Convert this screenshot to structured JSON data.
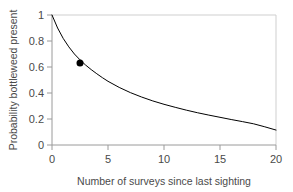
{
  "chart_data": {
    "type": "line",
    "title": "",
    "subtitle": "",
    "xlabel": "Number of surveys since last sighting",
    "ylabel": "Probability bottleweed present",
    "xlim": [
      0,
      20
    ],
    "ylim": [
      0,
      1
    ],
    "xticks": [
      0,
      5,
      10,
      15,
      20
    ],
    "xtick_labels": [
      "0",
      "5",
      "10",
      "15",
      "20"
    ],
    "yticks": [
      0,
      0.2,
      0.4,
      0.6,
      0.8,
      1
    ],
    "ytick_labels": [
      "0",
      "0.2",
      "0.4",
      "0.6",
      "0.8",
      "1"
    ],
    "grid": false,
    "legend": null,
    "legend_position": "none",
    "series": [
      {
        "name": "probability-curve",
        "type": "line",
        "color": "#000000",
        "linewidth": 1,
        "x": [
          0,
          0.5,
          1,
          1.5,
          2,
          2.5,
          3,
          3.5,
          4,
          4.5,
          5,
          6,
          7,
          8,
          9,
          10,
          11,
          12,
          13,
          14,
          15,
          16,
          17,
          18,
          19,
          20
        ],
        "y": [
          1.0,
          0.9,
          0.82,
          0.755,
          0.7,
          0.655,
          0.615,
          0.58,
          0.548,
          0.518,
          0.49,
          0.443,
          0.403,
          0.369,
          0.339,
          0.313,
          0.29,
          0.268,
          0.248,
          0.23,
          0.213,
          0.196,
          0.18,
          0.163,
          0.14,
          0.115
        ]
      },
      {
        "name": "highlighted-point",
        "type": "scatter",
        "color": "#000000",
        "marker": "filled-circle",
        "marker_size": 7,
        "x": [
          2.5
        ],
        "y": [
          0.63
        ]
      }
    ],
    "annotations": []
  },
  "axes": {
    "x_axis_label": "Number of surveys since last sighting",
    "y_axis_label": "Probability bottleweed present",
    "x_tick_labels": [
      "0",
      "5",
      "10",
      "15",
      "20"
    ],
    "y_tick_labels": [
      "1",
      "0.8",
      "0.6",
      "0.4",
      "0.2",
      "0"
    ],
    "frame_color": "#c8c8c8",
    "axis_color": "#8c8c8c",
    "text_color": "#4a4a4a",
    "background_color": "#ffffff"
  }
}
